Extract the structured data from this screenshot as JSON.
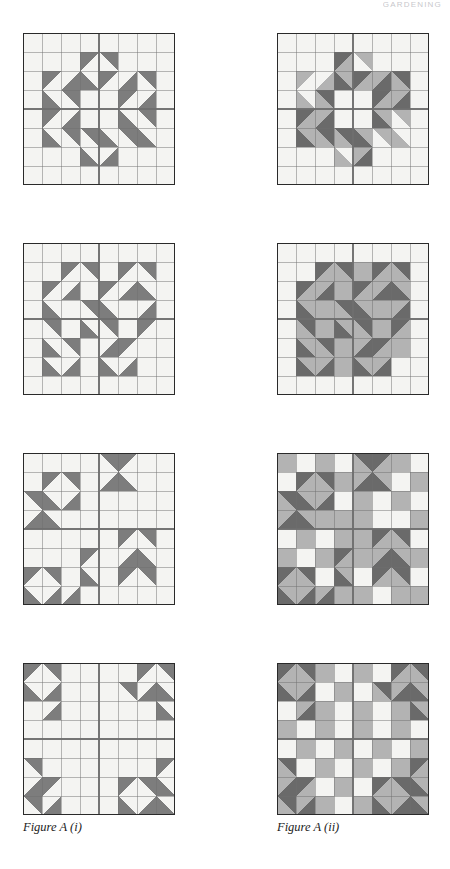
{
  "page": {
    "running_head": "GARDENING",
    "width": 450,
    "height": 869
  },
  "palette": {
    "background": "#ffffff",
    "light": "#f4f4f2",
    "lighter": "#fbfbfa",
    "medium": "#b3b3b3",
    "dark": "#7d7d7d",
    "darker": "#6a6a6a",
    "grid_line": "#6f6f6f",
    "border": "#2a2a2a",
    "caption_text": "#1b1b1b"
  },
  "columns": [
    {
      "id": "col-i",
      "caption": "Figure A (i)",
      "x": 23
    },
    {
      "id": "col-ii",
      "caption": "Figure A (ii)",
      "x": 277
    }
  ],
  "grid": {
    "rows": 8,
    "cols": 8,
    "cell_size": 19,
    "block_size": 152
  },
  "blocks": [
    {
      "id": "block-1",
      "name": "star-block-row1-left",
      "column": "col-i",
      "row": 1,
      "x": 23,
      "y": 33,
      "caption_ref": "Figure A (i)",
      "cells": [
        [
          "L",
          "L",
          "L",
          "L",
          "L",
          "L",
          "L",
          "L"
        ],
        [
          "L",
          "L",
          "L",
          "dTL",
          "dTR",
          "L",
          "L",
          "L"
        ],
        [
          "L",
          "dTL",
          "dBR",
          "dBL",
          "dTL",
          "dBR",
          "dTR",
          "L"
        ],
        [
          "L",
          "dBL",
          "dTR",
          "L",
          "L",
          "dTL",
          "dBR",
          "L"
        ],
        [
          "L",
          "dTL",
          "dBR",
          "L",
          "L",
          "dBL",
          "dTR",
          "L"
        ],
        [
          "L",
          "dBL",
          "dTR",
          "dTR",
          "dBL",
          "dTR",
          "dBL",
          "L"
        ],
        [
          "L",
          "L",
          "L",
          "dBL",
          "dBR",
          "L",
          "L",
          "L"
        ],
        [
          "L",
          "L",
          "L",
          "L",
          "L",
          "L",
          "L",
          "L"
        ]
      ]
    },
    {
      "id": "block-2",
      "name": "star-block-row1-right",
      "column": "col-ii",
      "row": 1,
      "x": 277,
      "y": 33,
      "caption_ref": "Figure A (ii)",
      "cells": [
        [
          "L",
          "L",
          "L",
          "L",
          "L",
          "L",
          "L",
          "L"
        ],
        [
          "L",
          "L",
          "L",
          "DTL",
          "mTR",
          "L",
          "L",
          "L"
        ],
        [
          "L",
          "mTL",
          "mBR",
          "DBL",
          "DTL",
          "DBR",
          "DTR",
          "L"
        ],
        [
          "L",
          "mBL",
          "DTR",
          "L",
          "L",
          "DTL",
          "DBR",
          "L"
        ],
        [
          "L",
          "DTL",
          "DBR",
          "L",
          "L",
          "DBL",
          "mTR",
          "L"
        ],
        [
          "L",
          "DBL",
          "DTR",
          "DTR",
          "DBL",
          "mTR",
          "mBL",
          "L"
        ],
        [
          "L",
          "L",
          "L",
          "mBL",
          "DBR",
          "L",
          "L",
          "L"
        ],
        [
          "L",
          "L",
          "L",
          "L",
          "L",
          "L",
          "L",
          "L"
        ]
      ]
    },
    {
      "id": "block-3",
      "name": "pinwheel-block-row2-left",
      "column": "col-i",
      "row": 2,
      "x": 23,
      "y": 243,
      "caption_ref": "Figure A (i)",
      "cells": [
        [
          "L",
          "L",
          "L",
          "L",
          "L",
          "L",
          "L",
          "L"
        ],
        [
          "L",
          "L",
          "dTL",
          "dTR",
          "L",
          "dTL",
          "dTR",
          "L"
        ],
        [
          "L",
          "dTL",
          "dBR",
          "L",
          "dTL",
          "dBR",
          "dBL",
          "L"
        ],
        [
          "L",
          "dBL",
          "L",
          "dTR",
          "dBL",
          "L",
          "dBR",
          "L"
        ],
        [
          "L",
          "dTR",
          "L",
          "dBL",
          "dTR",
          "L",
          "dTL",
          "L"
        ],
        [
          "L",
          "dBL",
          "dTR",
          "L",
          "dBR",
          "dTL",
          "L",
          "L"
        ],
        [
          "L",
          "dBL",
          "dBR",
          "L",
          "dBL",
          "dBR",
          "L",
          "L"
        ],
        [
          "L",
          "L",
          "L",
          "L",
          "L",
          "L",
          "L",
          "L"
        ]
      ]
    },
    {
      "id": "block-4",
      "name": "pinwheel-block-row2-right",
      "column": "col-ii",
      "row": 2,
      "x": 277,
      "y": 243,
      "caption_ref": "Figure A (ii)",
      "cells": [
        [
          "L",
          "L",
          "L",
          "L",
          "L",
          "L",
          "L",
          "L"
        ],
        [
          "L",
          "L",
          "DTL",
          "DTR",
          "M",
          "DTL",
          "DTR",
          "L"
        ],
        [
          "L",
          "DTL",
          "DBR",
          "M",
          "DTL",
          "DBR",
          "DBL",
          "L"
        ],
        [
          "L",
          "DBL",
          "M",
          "DTR",
          "DBL",
          "M",
          "DBR",
          "L"
        ],
        [
          "L",
          "DTR",
          "M",
          "DBL",
          "DTR",
          "M",
          "DTL",
          "L"
        ],
        [
          "L",
          "DBL",
          "DTR",
          "M",
          "DBR",
          "DTL",
          "M",
          "L"
        ],
        [
          "L",
          "DBL",
          "DBR",
          "M",
          "DBL",
          "DBR",
          "L",
          "L"
        ],
        [
          "L",
          "L",
          "L",
          "L",
          "L",
          "L",
          "L",
          "L"
        ]
      ]
    },
    {
      "id": "block-5",
      "name": "scattered-block-row3-left",
      "column": "col-i",
      "row": 3,
      "x": 23,
      "y": 453,
      "caption_ref": "Figure A (i)",
      "cells": [
        [
          "L",
          "L",
          "L",
          "L",
          "dTR",
          "dTL",
          "L",
          "L"
        ],
        [
          "L",
          "dTL",
          "dTR",
          "L",
          "dBR",
          "dBL",
          "L",
          "L"
        ],
        [
          "dTR",
          "dBL",
          "dBR",
          "L",
          "L",
          "L",
          "L",
          "L"
        ],
        [
          "dBR",
          "dBL",
          "L",
          "L",
          "L",
          "L",
          "L",
          "L"
        ],
        [
          "L",
          "L",
          "L",
          "L",
          "L",
          "dTL",
          "dTR",
          "L"
        ],
        [
          "L",
          "L",
          "L",
          "dTL",
          "L",
          "dBR",
          "dBL",
          "L"
        ],
        [
          "dTL",
          "dTR",
          "L",
          "dBL",
          "L",
          "dTL",
          "dTR",
          "L"
        ],
        [
          "dBL",
          "dBR",
          "dBR",
          "L",
          "L",
          "L",
          "L",
          "L"
        ]
      ]
    },
    {
      "id": "block-6",
      "name": "scattered-block-row3-right",
      "column": "col-ii",
      "row": 3,
      "x": 277,
      "y": 453,
      "caption_ref": "Figure A (ii)",
      "cells": [
        [
          "M",
          "L",
          "M",
          "L",
          "DTR",
          "DTL",
          "M",
          "L"
        ],
        [
          "L",
          "DTL",
          "DTR",
          "M",
          "DBR",
          "DBL",
          "L",
          "M"
        ],
        [
          "DTR",
          "DBL",
          "DBR",
          "L",
          "M",
          "L",
          "M",
          "L"
        ],
        [
          "DBR",
          "DBL",
          "M",
          "M",
          "M",
          "L",
          "L",
          "M"
        ],
        [
          "L",
          "M",
          "L",
          "M",
          "M",
          "DTL",
          "DTR",
          "L"
        ],
        [
          "M",
          "L",
          "M",
          "DTL",
          "M",
          "DBR",
          "DBL",
          "M"
        ],
        [
          "DTL",
          "DTR",
          "L",
          "DBL",
          "L",
          "DTL",
          "DTR",
          "L"
        ],
        [
          "DBL",
          "DBR",
          "DBR",
          "M",
          "M",
          "L",
          "M",
          "M"
        ]
      ]
    },
    {
      "id": "block-7",
      "name": "corner-arrow-block-row4-left",
      "column": "col-i",
      "row": 4,
      "x": 23,
      "y": 663,
      "caption_ref": "Figure A (i)",
      "cells": [
        [
          "dTL",
          "dTR",
          "L",
          "L",
          "L",
          "L",
          "dTL",
          "dTR"
        ],
        [
          "dBL",
          "dBR",
          "L",
          "L",
          "L",
          "dTR",
          "dBR",
          "dBL"
        ],
        [
          "L",
          "dBR",
          "L",
          "L",
          "L",
          "L",
          "L",
          "dBL"
        ],
        [
          "L",
          "L",
          "L",
          "L",
          "L",
          "L",
          "L",
          "L"
        ],
        [
          "L",
          "L",
          "L",
          "L",
          "L",
          "L",
          "L",
          "L"
        ],
        [
          "dTR",
          "L",
          "L",
          "L",
          "L",
          "L",
          "L",
          "dTL"
        ],
        [
          "dBR",
          "dTL",
          "L",
          "L",
          "L",
          "dTL",
          "dTR",
          "dBL"
        ],
        [
          "dTR",
          "dBR",
          "L",
          "L",
          "L",
          "dBL",
          "dBR",
          "dBL"
        ]
      ]
    },
    {
      "id": "block-8",
      "name": "corner-arrow-block-row4-right",
      "column": "col-ii",
      "row": 4,
      "x": 277,
      "y": 663,
      "caption_ref": "Figure A (ii)",
      "cells": [
        [
          "DTL",
          "DTR",
          "M",
          "L",
          "M",
          "L",
          "DTL",
          "DTR"
        ],
        [
          "DBL",
          "DBR",
          "L",
          "M",
          "L",
          "DTR",
          "DBR",
          "DBL"
        ],
        [
          "L",
          "DBR",
          "M",
          "L",
          "M",
          "L",
          "M",
          "DBL"
        ],
        [
          "M",
          "L",
          "M",
          "L",
          "M",
          "L",
          "M",
          "L"
        ],
        [
          "L",
          "M",
          "L",
          "M",
          "L",
          "M",
          "L",
          "M"
        ],
        [
          "DTR",
          "L",
          "M",
          "L",
          "M",
          "L",
          "M",
          "DTL"
        ],
        [
          "DBR",
          "DTL",
          "L",
          "M",
          "L",
          "DTL",
          "DTR",
          "DBL"
        ],
        [
          "DTR",
          "DBR",
          "M",
          "L",
          "M",
          "DBL",
          "DBR",
          "DBL"
        ]
      ]
    }
  ],
  "cell_legend": {
    "L": "light-plain",
    "M": "medium-plain",
    "D": "dark-plain",
    "dTL": "dark-triangle-top-left",
    "dTR": "dark-triangle-top-right",
    "dBL": "dark-triangle-bottom-left",
    "dBR": "dark-triangle-bottom-right",
    "DTL": "darker-triangle-top-left-on-medium",
    "DTR": "darker-triangle-top-right-on-medium",
    "DBL": "darker-triangle-bottom-left-on-medium",
    "DBR": "darker-triangle-bottom-right-on-medium",
    "mTL": "medium-triangle-top-left",
    "mTR": "medium-triangle-top-right",
    "mBL": "medium-triangle-bottom-left",
    "mBR": "medium-triangle-bottom-right"
  }
}
